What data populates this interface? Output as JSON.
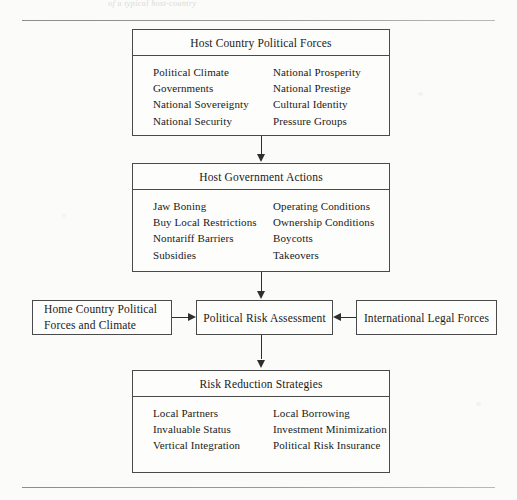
{
  "page": {
    "caption_ghost": "of a typical host-country",
    "background_color": "#fbfbfa",
    "line_color": "#2f2f2f",
    "box_border_color": "#4a4a4a"
  },
  "boxes": {
    "host_country_political_forces": {
      "title": "Host Country Political Forces",
      "column_left": [
        "Political Climate",
        "Governments",
        "National Sovereignty",
        "National Security"
      ],
      "column_right": [
        "National Prosperity",
        "National Prestige",
        "Cultural Identity",
        "Pressure Groups"
      ]
    },
    "host_government_actions": {
      "title": "Host Government Actions",
      "column_left": [
        "Jaw Boning",
        "Buy Local Restrictions",
        "Nontariff Barriers",
        "Subsidies"
      ],
      "column_right": [
        "Operating Conditions",
        "Ownership Conditions",
        "Boycotts",
        "Takeovers"
      ]
    },
    "home_country_political_forces": {
      "title": "Home Country Political Forces and Climate"
    },
    "political_risk_assessment": {
      "title": "Political Risk Assessment"
    },
    "international_legal_forces": {
      "title": "International Legal Forces"
    },
    "risk_reduction_strategies": {
      "title": "Risk Reduction Strategies",
      "column_left": [
        "Local Partners",
        "Invaluable Status",
        "Vertical Integration"
      ],
      "column_right": [
        "Local Borrowing",
        "Investment Minimization",
        "Political Risk Insurance"
      ]
    }
  }
}
